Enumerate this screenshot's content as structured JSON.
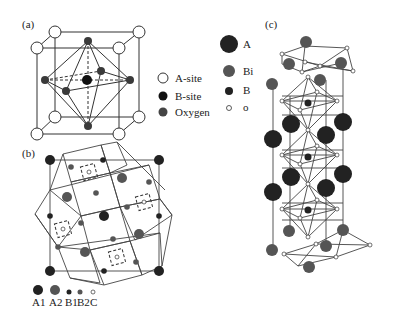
{
  "figure": {
    "panels": [
      {
        "id": "a",
        "label": "(a)"
      },
      {
        "id": "b",
        "label": "(b)"
      },
      {
        "id": "c",
        "label": "(c)"
      }
    ],
    "legend_a": [
      {
        "label": "A-site",
        "style": "open",
        "color": "#ffffff"
      },
      {
        "label": "B-site",
        "style": "filled",
        "color": "#111111"
      },
      {
        "label": "Oxygen",
        "style": "filled",
        "color": "#444444"
      }
    ],
    "legend_b": [
      {
        "label": "A1"
      },
      {
        "label": "A2"
      },
      {
        "label": "B1"
      },
      {
        "label": "B2"
      },
      {
        "label": "C"
      }
    ],
    "legend_c": [
      {
        "label": "A",
        "color": "#222222"
      },
      {
        "label": "Bi",
        "color": "#555555"
      },
      {
        "label": "B",
        "color": "#222222"
      },
      {
        "label": "o",
        "color": "#ffffff"
      }
    ],
    "colors": {
      "line": "#333333",
      "a_site_dark": "#222222",
      "bi": "#555555",
      "oxygen_b": "#444444",
      "open": "#ffffff"
    }
  }
}
